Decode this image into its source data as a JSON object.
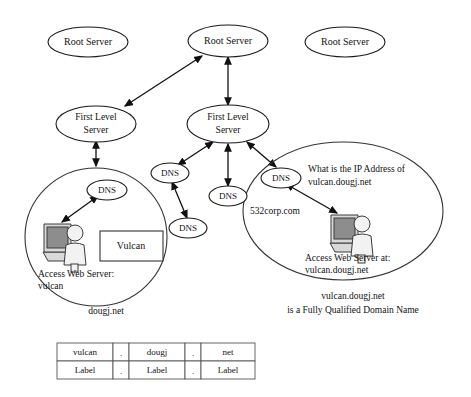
{
  "diagram": {
    "root_servers": [
      {
        "label": "Root Server"
      },
      {
        "label": "Root Server"
      },
      {
        "label": "Root Server"
      }
    ],
    "first_level_servers": [
      {
        "label": "First Level\nServer",
        "line1": "First Level",
        "line2": "Server"
      },
      {
        "label": "First Level\nServer",
        "line1": "First Level",
        "line2": "Server"
      }
    ],
    "dns_nodes": [
      {
        "label": "DNS"
      },
      {
        "label": "DNS"
      },
      {
        "label": "DNS"
      },
      {
        "label": "DNS"
      },
      {
        "label": "DNS"
      }
    ],
    "left_zone": {
      "name": "dougj.net",
      "server_box_label": "Vulcan",
      "dns_label": "DNS",
      "caption_line1": "Access Web Server:",
      "caption_line2": "vulcan"
    },
    "right_zone": {
      "name": "532corp.com",
      "dns_label": "DNS",
      "query_line1": "What is the IP Address of",
      "query_line2": "vulcan.dougj.net",
      "caption_line1": "Access Web Server at:",
      "caption_line2": "vulcan.dougj.net"
    },
    "footnote": {
      "line1": "vulcan.dougj.net",
      "line2": "is a Fully Qualified Domain Name"
    },
    "fqdn_table": {
      "rows": [
        [
          "vulcan",
          ".",
          "dougj",
          ".",
          "net"
        ],
        [
          "Label",
          ".",
          "Label",
          ".",
          "Label"
        ]
      ]
    },
    "colors": {
      "ink": "#111111",
      "stroke": "#333333",
      "screen": "#8d8d8d",
      "background": "#ffffff"
    }
  }
}
